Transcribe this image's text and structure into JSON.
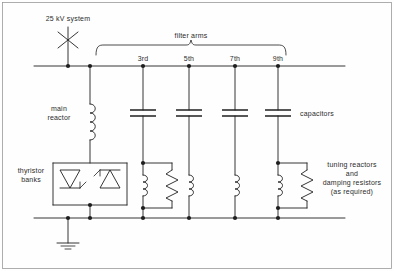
{
  "diagram": {
    "title_label": "25 kV system",
    "group_label": "filter arms",
    "labels": {
      "main_reactor": "main\nreactor",
      "thyristor_banks": "thyristor\nbanks",
      "capacitors": "capacitors",
      "tuning_damping": "tuning reactors\nand\ndamping resistors\n(as required)"
    },
    "filter_arms": [
      {
        "order": "3rd",
        "x": 143,
        "has_capacitor": true,
        "has_reactor": true,
        "has_damping_resistor": true
      },
      {
        "order": "5th",
        "x": 189,
        "has_capacitor": true,
        "has_reactor": true,
        "has_damping_resistor": false
      },
      {
        "order": "7th",
        "x": 235,
        "has_capacitor": true,
        "has_reactor": true,
        "has_damping_resistor": false
      },
      {
        "order": "9th",
        "x": 278,
        "has_capacitor": true,
        "has_reactor": true,
        "has_damping_resistor": true
      }
    ],
    "buses": {
      "top_bus_y": 66,
      "bottom_bus_y": 218,
      "bus_left_x": 34,
      "bus_right_x": 345
    },
    "source": {
      "breaker_x": 68,
      "breaker_symbol": "disconnect-cross"
    },
    "tcr_branch": {
      "x": 90,
      "reactor_label_side": "left",
      "thyristor_left_direction": "down",
      "thyristor_right_direction": "up"
    },
    "ground": {
      "x": 68,
      "symbol": "earth-ground"
    },
    "colors": {
      "line": "#1f1f1f",
      "text": "#2b2b2b",
      "background": "#fefefe",
      "border": "#9a9a9a"
    }
  }
}
